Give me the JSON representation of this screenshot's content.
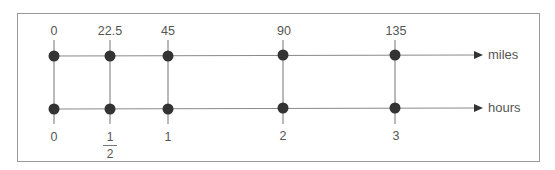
{
  "diagram": {
    "type": "double-number-line",
    "top_line": {
      "unit": "miles",
      "ticks": [
        "0",
        "22.5",
        "45",
        "90",
        "135"
      ]
    },
    "bottom_line": {
      "unit": "hours",
      "ticks": [
        "0",
        "1/2",
        "1",
        "2",
        "3"
      ],
      "fraction_tick": {
        "numerator": "1",
        "denominator": "2"
      }
    },
    "colors": {
      "line": "#8a8a8a",
      "point": "#333333",
      "text": "#555555",
      "frame": "#9a9a9a"
    }
  }
}
